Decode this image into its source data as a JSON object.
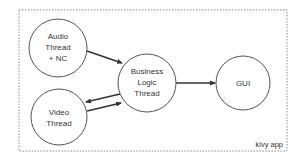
{
  "diagram": {
    "container": {
      "label": "kivy app",
      "x": 19,
      "y": 10,
      "width": 268,
      "height": 141,
      "border_color": "#888888"
    },
    "nodes": [
      {
        "id": "audio",
        "lines": [
          "Audio",
          "Thread",
          "+ NC"
        ],
        "cx": 58,
        "cy": 48,
        "r": 29
      },
      {
        "id": "video",
        "lines": [
          "Video",
          "Thread"
        ],
        "cx": 59,
        "cy": 117,
        "r": 28
      },
      {
        "id": "business",
        "lines": [
          "Business",
          "Logic",
          "Thread"
        ],
        "cx": 147,
        "cy": 83,
        "r": 29
      },
      {
        "id": "gui",
        "lines": [
          "GUI"
        ],
        "cx": 243,
        "cy": 83,
        "r": 27
      }
    ],
    "edges": [
      {
        "from": "audio",
        "to": "business",
        "x1": 87,
        "y1": 51,
        "x2": 122,
        "y2": 63
      },
      {
        "from": "business",
        "to": "video",
        "x1": 120,
        "y1": 94,
        "x2": 86,
        "y2": 102
      },
      {
        "from": "video",
        "to": "business",
        "x1": 87,
        "y1": 111,
        "x2": 121,
        "y2": 103
      },
      {
        "from": "business",
        "to": "gui",
        "x1": 176,
        "y1": 83,
        "x2": 215,
        "y2": 83
      }
    ],
    "colors": {
      "stroke": "#555555",
      "arrow": "#333333",
      "text": "#333333",
      "background": "#ffffff"
    }
  }
}
